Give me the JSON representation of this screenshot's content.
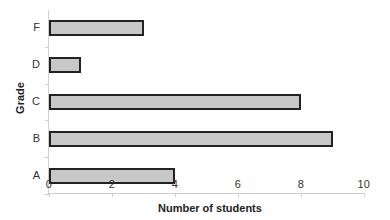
{
  "chart_data": {
    "type": "bar",
    "orientation": "horizontal",
    "title": "",
    "xlabel": "Number of students",
    "ylabel": "Grade",
    "categories": [
      "A",
      "B",
      "C",
      "D",
      "F"
    ],
    "values": [
      4,
      9,
      8,
      1,
      3
    ],
    "xlim": [
      0,
      10
    ],
    "x_ticks": [
      0,
      2,
      4,
      6,
      8,
      10
    ],
    "grid": false,
    "legend": null,
    "bar_color": "#c8c8c8",
    "bar_border_color": "#222222"
  }
}
